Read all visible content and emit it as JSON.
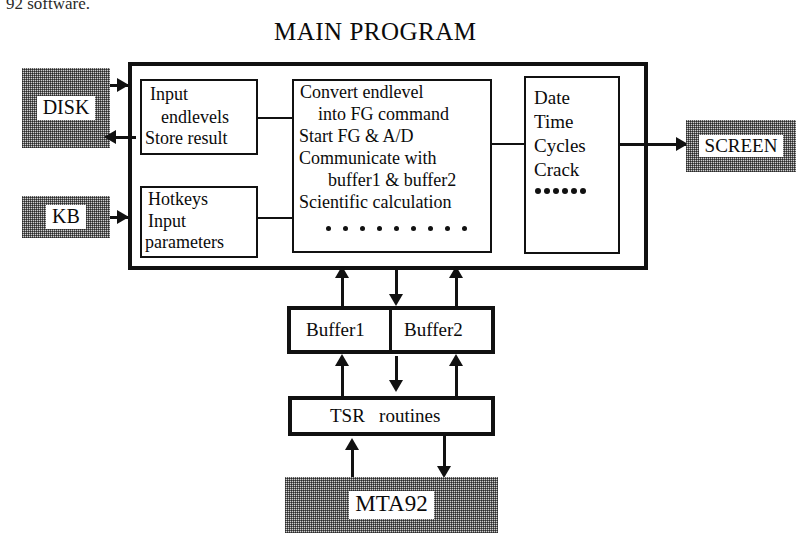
{
  "page": {
    "top_caption": "92 software.",
    "diagram_title": "MAIN PROGRAM"
  },
  "external_devices": [
    {
      "id": "disk",
      "label": "DISK"
    },
    {
      "id": "kb",
      "label": "KB"
    },
    {
      "id": "screen",
      "label": "SCREEN"
    },
    {
      "id": "mta92",
      "label": "MTA92"
    }
  ],
  "main_program": {
    "title": "MAIN PROGRAM",
    "input_block": {
      "line1": "Input",
      "line2": "endlevels",
      "line3": "Store result"
    },
    "hotkeys_block": {
      "line1": "Hotkeys",
      "line2": "Input",
      "line3": "parameters"
    },
    "process_block": {
      "line1": "Convert endlevel",
      "line2": "into FG command",
      "line3": "Start FG & A/D",
      "line4": "Communicate with",
      "line5": "buffer1 & buffer2",
      "line6": "Scientific calculation",
      "ellipsis_dots": 9
    },
    "output_block": {
      "line1": "Date",
      "line2": "Time",
      "line3": "Cycles",
      "line4": "Crack",
      "ellipsis_dots": 6
    }
  },
  "buffers": {
    "buffer1_label": "Buffer1",
    "buffer2_label": "Buffer2"
  },
  "tsr": {
    "label": "TSR   routines"
  },
  "colors": {
    "line": "#111111",
    "device_fill": "#cfcfcf",
    "background": "#ffffff"
  }
}
